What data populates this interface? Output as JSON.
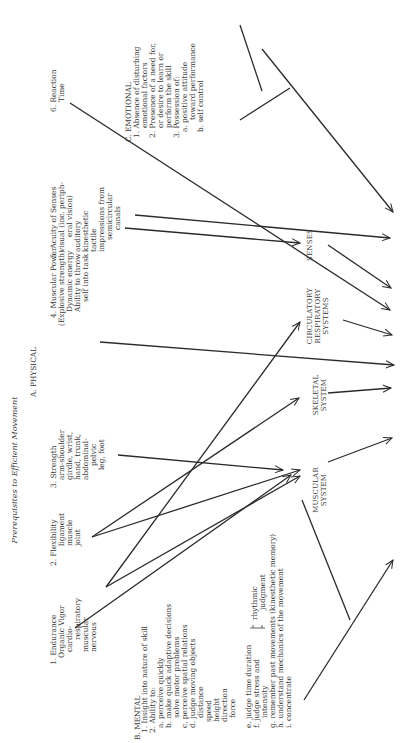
{
  "title": "Prerequisites to Efficient Movement",
  "physical": {
    "heading": "A. PHYSICAL",
    "items": [
      {
        "lines": [
          "1. Endurance",
          "Organic Vigor",
          "cardio-",
          "respiratory",
          "muscular",
          "nervous"
        ]
      },
      {
        "lines": [
          "2. Flexibility",
          "ligament",
          "muscle",
          "joint"
        ]
      },
      {
        "lines": [
          "3. Strength",
          "arm-shoulder",
          "girdle, wrist,",
          "hand, trunk,",
          "abdominal-",
          "pelvic",
          "leg, foot"
        ]
      },
      {
        "lines": [
          "4. Muscular Power",
          "(Explosive strength)",
          "Dynamic energy",
          "Ability to throw",
          "self into task"
        ]
      },
      {
        "lines": [
          "5. Acuity of Senses",
          "visual (inc. periph-",
          "eral vision)",
          "auditory",
          "kinesthetic",
          "tactile",
          "impressions from",
          "semicircular",
          "canals"
        ]
      },
      {
        "lines": [
          "6. Reaction",
          "Time"
        ]
      }
    ]
  },
  "mental": {
    "heading": "B. MENTAL",
    "lines": [
      "1. Insight into nature of skill",
      "2. Ability to:",
      "a. perceive quickly",
      "b. make quick adaptive decisions",
      "solve motor problems",
      "c. perceive spatial relations",
      "d. judge moving objects",
      "distance",
      "speed",
      "height",
      "direction",
      "force",
      "e. judge time duration",
      "f. judge stress and",
      "intensity",
      "g. remember past movements (kinesthetic memory)",
      "h. understand mechanics of the movement",
      "i. concentrate"
    ],
    "bracket_label": [
      "rhythmic",
      "judgment"
    ]
  },
  "emotional": {
    "heading": "C. EMOTIONAL",
    "lines": [
      "1. Absence of disturbing",
      "emotional factors",
      "2. Presence of a need for,",
      "or desire to learn or",
      "perform the skill",
      "3. Possession of:",
      "a. positive attitude",
      "toward performance",
      "b. self control"
    ]
  },
  "systems": {
    "muscular": [
      "MUSCULAR",
      "SYSTEM"
    ],
    "skeletal": [
      "SKELETAL",
      "SYSTEM"
    ],
    "circulatory": [
      "CIRCULATORY",
      "RESPIRATORY",
      "SYSTEMS"
    ],
    "senses": [
      "SENSES"
    ]
  }
}
